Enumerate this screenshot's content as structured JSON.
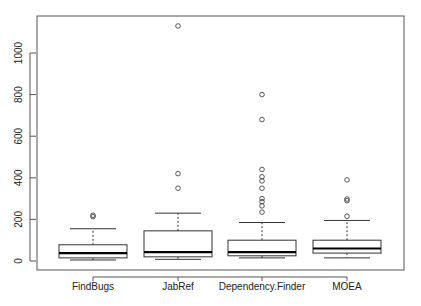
{
  "chart_data": {
    "type": "boxplot",
    "title": "",
    "xlabel": "",
    "ylabel": "",
    "ylim": [
      -40,
      1180
    ],
    "yticks": [
      0,
      200,
      400,
      600,
      800,
      1000
    ],
    "grid": false,
    "legend": null,
    "categories": [
      "FindBugs",
      "JabRef",
      "Dependency.Finder",
      "MOEA"
    ],
    "boxes": [
      {
        "name": "FindBugs",
        "whisker_low": 5,
        "q1": 15,
        "median": 38,
        "q3": 78,
        "whisker_high": 155,
        "outliers": [
          213,
          220
        ]
      },
      {
        "name": "JabRef",
        "whisker_low": 8,
        "q1": 20,
        "median": 43,
        "q3": 145,
        "whisker_high": 230,
        "outliers": [
          350,
          420,
          1130
        ]
      },
      {
        "name": "Dependency.Finder",
        "whisker_low": 15,
        "q1": 25,
        "median": 43,
        "q3": 100,
        "whisker_high": 185,
        "outliers": [
          235,
          265,
          285,
          300,
          350,
          385,
          405,
          440,
          680,
          800
        ]
      },
      {
        "name": "MOEA",
        "whisker_low": 15,
        "q1": 38,
        "median": 60,
        "q3": 100,
        "whisker_high": 195,
        "outliers": [
          215,
          290,
          298,
          390
        ]
      }
    ]
  }
}
